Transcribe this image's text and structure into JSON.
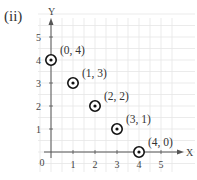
{
  "figure": {
    "label": "(ii)"
  },
  "chart_data": {
    "type": "scatter",
    "title": "",
    "xlabel": "X",
    "ylabel": "Y",
    "xlim": [
      0,
      5.5
    ],
    "ylim": [
      0,
      5.5
    ],
    "x_ticks": [
      "1",
      "2",
      "3",
      "4",
      "5"
    ],
    "y_ticks": [
      "1",
      "2",
      "3",
      "4",
      "5"
    ],
    "origin_label": "0",
    "grid": true,
    "series": [
      {
        "name": "points",
        "marker": "circled-dot",
        "points": [
          {
            "x": 0,
            "y": 4,
            "label": "(0, 4)"
          },
          {
            "x": 1,
            "y": 3,
            "label": "(1, 3)"
          },
          {
            "x": 2,
            "y": 2,
            "label": "(2, 2)"
          },
          {
            "x": 3,
            "y": 1,
            "label": "(3, 1)"
          },
          {
            "x": 4,
            "y": 0,
            "label": "(4, 0)"
          }
        ]
      }
    ]
  },
  "colors": {
    "axis": "#555555",
    "grid": "#e6e6e6",
    "marker": "#111111"
  }
}
